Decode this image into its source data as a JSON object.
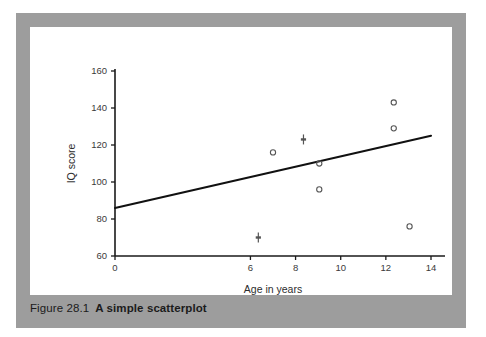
{
  "figure": {
    "caption_number": "Figure 28.1",
    "caption_title": "A simple scatterplot",
    "panel_color": "#9d9d9d",
    "card_color": "#ffffff"
  },
  "chart_data": {
    "type": "scatter",
    "title": "",
    "xlabel": "Age in years",
    "ylabel": "IQ score",
    "xlim": [
      0,
      14
    ],
    "ylim": [
      60,
      160
    ],
    "xticks": [
      0,
      6,
      8,
      10,
      12,
      14
    ],
    "xtick_labels": [
      "0",
      "6",
      "8",
      "10",
      "12",
      "14"
    ],
    "yticks": [
      60,
      80,
      100,
      120,
      140,
      160
    ],
    "ytick_labels": [
      "60",
      "80",
      "100",
      "120",
      "140",
      "160"
    ],
    "grid": false,
    "legend": false,
    "axis_color": "#1a1a1a",
    "marker_color": "#555555",
    "trendline_color": "#111111",
    "points": [
      {
        "x": 6.35,
        "y": 70,
        "marker": "dash"
      },
      {
        "x": 7.0,
        "y": 116,
        "marker": "circle"
      },
      {
        "x": 8.35,
        "y": 123,
        "marker": "dash"
      },
      {
        "x": 9.05,
        "y": 110,
        "marker": "circle"
      },
      {
        "x": 9.05,
        "y": 96,
        "marker": "circle"
      },
      {
        "x": 12.35,
        "y": 143,
        "marker": "circle"
      },
      {
        "x": 12.35,
        "y": 129,
        "marker": "circle"
      },
      {
        "x": 13.05,
        "y": 76,
        "marker": "circle"
      }
    ],
    "trendline": {
      "x_start": 0,
      "y_start": 86,
      "x_end": 14,
      "y_end": 125
    }
  }
}
